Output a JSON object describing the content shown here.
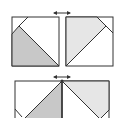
{
  "diagram": {
    "colors": {
      "stroke": "#333333",
      "dark_fill": "#c8c8c8",
      "light_fill": "#e6e6e6",
      "background": "#ffffff"
    },
    "arrows": [
      {
        "name": "join-arrow-top",
        "symbol": "double-headed-arrow"
      },
      {
        "name": "join-arrow-bottom",
        "symbol": "double-headed-arrow"
      }
    ],
    "units": [
      {
        "name": "left-unit",
        "fill": "dark"
      },
      {
        "name": "right-unit",
        "fill": "light"
      },
      {
        "name": "joined-unit",
        "fill": "dark-and-light"
      }
    ]
  }
}
